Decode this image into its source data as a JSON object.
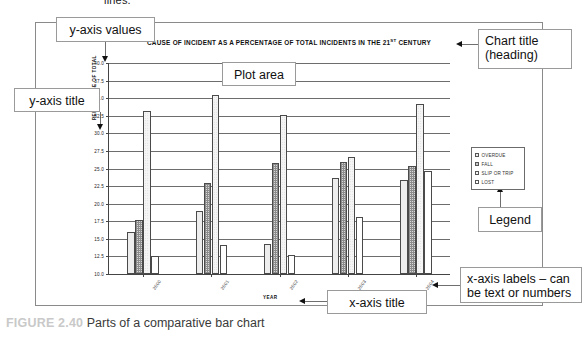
{
  "page": {
    "top_cut_text": "lines.",
    "caption_number": "FIGURE 2.40",
    "caption_text": "Parts of a comparative bar chart"
  },
  "callouts": {
    "y_axis_values": "y-axis values",
    "y_axis_title": "y-axis title",
    "plot_area": "Plot area",
    "chart_title": "Chart title\n(heading)",
    "chart_title_line1": "Chart title",
    "chart_title_line2": "(heading)",
    "legend": "Legend",
    "x_axis_labels_line1": "x-axis labels – can",
    "x_axis_labels_line2": "be text or numbers",
    "x_axis_title": "x-axis title"
  },
  "chart_data": {
    "type": "bar",
    "title": "CAUSE OF INCIDENT AS A PERCENTAGE OF TOTAL INCIDENTS IN THE 21ST CENTURY",
    "title_main": "CAUSE OF INCIDENT AS A PERCENTAGE OF TOTAL INCIDENTS IN THE 21",
    "title_sup": "ST",
    "title_tail": " CENTURY",
    "xlabel": "YEAR",
    "ylabel": "PERCENTAGE OF TOTAL",
    "categories": [
      "2000",
      "2001",
      "2002",
      "2003",
      "2004"
    ],
    "ylim": [
      10.0,
      40.0
    ],
    "ytick_step": 2.5,
    "ytick_labels": [
      "40.0",
      "37.5",
      "35.0",
      "32.5",
      "30.0",
      "27.5",
      "25.0",
      "22.5",
      "20.0",
      "17.5",
      "15.0",
      "12.5",
      "10.0"
    ],
    "grid": true,
    "legend_position": "right",
    "series": [
      {
        "name": "OVERDUE",
        "values": [
          16.0,
          19.0,
          14.3,
          23.6,
          23.3
        ]
      },
      {
        "name": "FALL",
        "values": [
          17.7,
          23.0,
          25.8,
          25.9,
          25.3
        ]
      },
      {
        "name": "SLIP OR TRIP",
        "values": [
          33.2,
          35.4,
          32.6,
          26.6,
          34.2
        ]
      },
      {
        "name": "LOST",
        "values": [
          12.6,
          14.1,
          12.7,
          18.1,
          24.7
        ]
      }
    ]
  }
}
